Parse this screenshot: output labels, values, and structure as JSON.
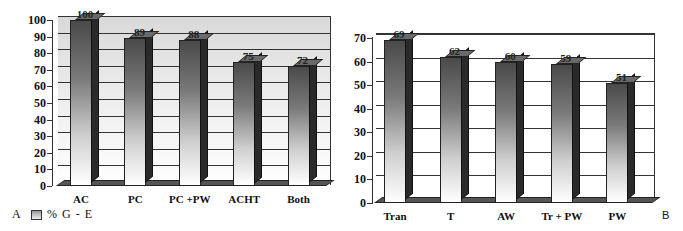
{
  "chart_data": [
    {
      "id": "A",
      "type": "bar",
      "title": "",
      "panel_label": "A",
      "categories": [
        "AC",
        "PC",
        "PC +PW",
        "ACHT",
        "Both"
      ],
      "values": [
        100,
        89,
        88,
        75,
        72
      ],
      "data_labels": [
        "100",
        "89",
        "88",
        "75",
        "72"
      ],
      "xlabel": "",
      "ylabel": "",
      "ylim": [
        0,
        100
      ],
      "yticks": [
        0,
        10,
        20,
        30,
        40,
        50,
        60,
        70,
        80,
        90,
        100
      ],
      "grid": true,
      "style": "3d-bar-gradient",
      "legend": {
        "entries": [
          "% G - E"
        ],
        "position": "bottom-left"
      }
    },
    {
      "id": "B",
      "type": "bar",
      "title": "",
      "panel_label": "B",
      "categories": [
        "Tran",
        "T",
        "AW",
        "Tr + PW",
        "PW"
      ],
      "values": [
        69,
        62,
        60,
        59,
        51
      ],
      "data_labels": [
        "69",
        "62",
        "60",
        "59",
        "51"
      ],
      "xlabel": "",
      "ylabel": "",
      "ylim": [
        0,
        70
      ],
      "yticks": [
        0,
        10,
        20,
        30,
        40,
        50,
        60,
        70
      ],
      "grid": true,
      "style": "3d-bar-gradient"
    }
  ],
  "legend": {
    "panel": "A",
    "text": "% G - E"
  },
  "panels": {
    "a_label": "A",
    "b_label": "B"
  },
  "colors": {
    "bar_dark": "#4a4a4a",
    "bar_light": "#ffffff",
    "bar_side": "#2a2a2a",
    "floor": "#555555",
    "grid": "#333333"
  }
}
